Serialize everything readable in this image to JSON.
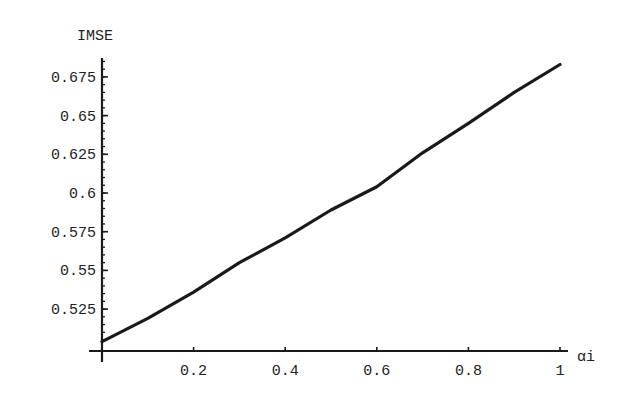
{
  "chart_data": {
    "type": "line",
    "title": "",
    "xlabel": "αi",
    "ylabel": "IMSE",
    "xlim": [
      0,
      1
    ],
    "ylim": [
      0.503,
      0.69
    ],
    "grid": false,
    "legend": null,
    "x_ticks": [
      0.2,
      0.4,
      0.6,
      0.8,
      1
    ],
    "x_tick_labels": [
      "0.2",
      "0.4",
      "0.6",
      "0.8",
      "1"
    ],
    "y_ticks": [
      0.525,
      0.55,
      0.575,
      0.6,
      0.625,
      0.65,
      0.675
    ],
    "y_tick_labels": [
      "0.525",
      "0.55",
      "0.575",
      "0.6",
      "0.625",
      "0.65",
      "0.675"
    ],
    "x": [
      0,
      0.1,
      0.2,
      0.3,
      0.4,
      0.5,
      0.6,
      0.7,
      0.8,
      0.9,
      1.0
    ],
    "series": [
      {
        "name": "IMSE",
        "values": [
          0.504,
          0.519,
          0.536,
          0.555,
          0.571,
          0.589,
          0.604,
          0.626,
          0.645,
          0.665,
          0.683
        ]
      }
    ]
  },
  "colors": {
    "line": "#1a1a1a",
    "axis": "#1a1a1a",
    "background": "#ffffff"
  }
}
